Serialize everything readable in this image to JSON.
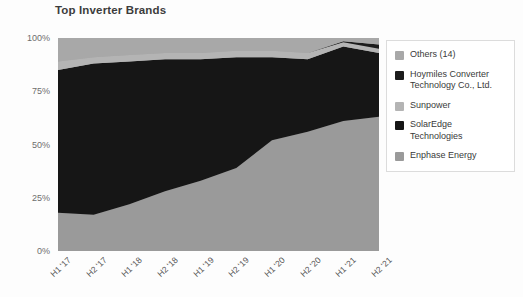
{
  "chart_data": {
    "type": "area",
    "title": "Top Inverter Brands",
    "subtitle": "",
    "xlabel": "",
    "ylabel": "",
    "stacked": true,
    "normalized": true,
    "grid": false,
    "legend_position": "right",
    "ylim": [
      0,
      100
    ],
    "y_ticks": [
      0,
      25,
      50,
      75,
      100
    ],
    "y_tick_labels": [
      "0%",
      "25%",
      "50%",
      "75%",
      "100%"
    ],
    "categories": [
      "H1 '17",
      "H2 '17",
      "H1 '18",
      "H2 '18",
      "H1 '19",
      "H2 '19",
      "H1 '20",
      "H2 '20",
      "H1 '21",
      "H2 '21"
    ],
    "series": [
      {
        "name": "Enphase Energy",
        "color": "#9a9a9a",
        "values": [
          18,
          17,
          22,
          28,
          33,
          39,
          52,
          56,
          61,
          63
        ]
      },
      {
        "name": "SolarEdge Technologies",
        "color": "#161616",
        "values": [
          67,
          71,
          67,
          62,
          57,
          52,
          39,
          34,
          35,
          30
        ]
      },
      {
        "name": "Sunpower",
        "color": "#b4b4b4",
        "values": [
          4,
          3,
          3,
          3,
          3,
          3,
          3,
          3,
          2,
          2
        ]
      },
      {
        "name": "Hoymiles Converter Technology Co., Ltd.",
        "color": "#1c1c1c",
        "values": [
          0,
          0,
          0,
          0,
          0,
          0,
          0,
          0,
          0.5,
          2
        ]
      },
      {
        "name": "Others (14)",
        "color": "#a8a8a8",
        "values": [
          11,
          9,
          8,
          7,
          7,
          6,
          6,
          7,
          1.5,
          3
        ]
      }
    ]
  },
  "legend": {
    "items": [
      {
        "label": "Others (14)",
        "color": "#a8a8a8"
      },
      {
        "label": "Hoymiles Converter\nTechnology Co., Ltd.",
        "color": "#1c1c1c"
      },
      {
        "label": "Sunpower",
        "color": "#b4b4b4"
      },
      {
        "label": "SolarEdge\nTechnologies",
        "color": "#161616"
      },
      {
        "label": "Enphase Energy",
        "color": "#9a9a9a"
      }
    ]
  },
  "colors": {
    "background": "#fdfdfd",
    "title": "#3c3c3c",
    "axis_text": "#6d6d6d",
    "legend_border": "#dcdcdc"
  }
}
